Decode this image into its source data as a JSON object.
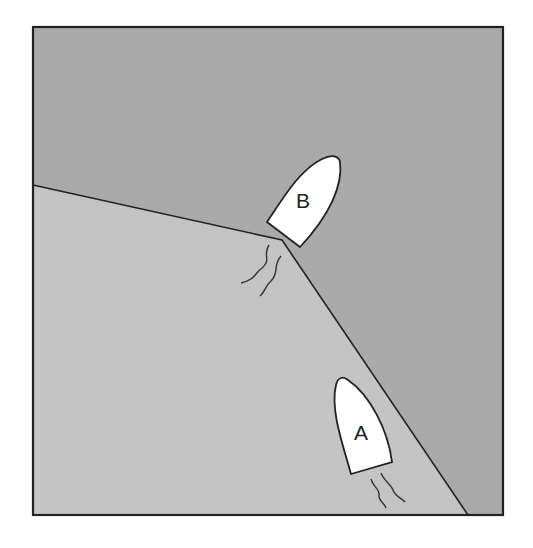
{
  "diagram": {
    "colors": {
      "background": "#ffffff",
      "upper_water": "#aaaaaa",
      "lower_water": "#c4c4c4",
      "line": "#222222",
      "boat_fill": "#ffffff"
    },
    "boats": [
      {
        "id": "B",
        "label": "B"
      },
      {
        "id": "A",
        "label": "A"
      }
    ]
  }
}
